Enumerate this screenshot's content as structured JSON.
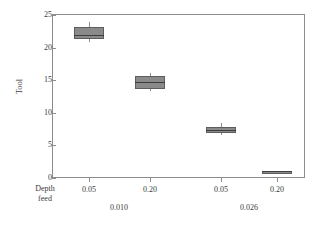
{
  "chart_data": {
    "type": "box",
    "title": "",
    "xlabel": "",
    "ylabel": "Tool",
    "ylim": [
      0,
      25
    ],
    "yticks": [
      0,
      5,
      10,
      15,
      20,
      25
    ],
    "ytick_labels": [
      "0",
      "5",
      "10",
      "15",
      "20",
      "25"
    ],
    "grid": false,
    "legend": "none",
    "x_axis_row_labels": [
      "Depth",
      "feed"
    ],
    "categories": [
      "0.05",
      "0.20",
      "0.05",
      "0.20"
    ],
    "groups": [
      {
        "label": "0.010",
        "categories": [
          "0.05",
          "0.20"
        ]
      },
      {
        "label": "0.026",
        "categories": [
          "0.05",
          "0.20"
        ]
      }
    ],
    "boxes": [
      {
        "category": "0.05",
        "group": "0.010",
        "whisker_low": 20.8,
        "q1": 21.3,
        "median": 22.0,
        "q3": 23.2,
        "whisker_high": 23.9
      },
      {
        "category": "0.20",
        "group": "0.010",
        "whisker_low": 13.3,
        "q1": 13.6,
        "median": 14.7,
        "q3": 15.6,
        "whisker_high": 16.1
      },
      {
        "category": "0.05",
        "group": "0.026",
        "whisker_low": 6.6,
        "q1": 6.9,
        "median": 7.3,
        "q3": 7.8,
        "whisker_high": 8.4
      },
      {
        "category": "0.20",
        "group": "0.026",
        "whisker_low": 1.0,
        "q1": 1.0,
        "median": 1.0,
        "q3": 1.1,
        "whisker_high": 1.1
      }
    ],
    "colors": {
      "box_fill": "#8a8a8a",
      "box_edge": "#5d5d5d",
      "median": "#3d3d3d",
      "whisker": "#8c8c8c",
      "frame": "#8c8c8c",
      "text": "#3a3a3a",
      "background": "#ffffff"
    }
  }
}
